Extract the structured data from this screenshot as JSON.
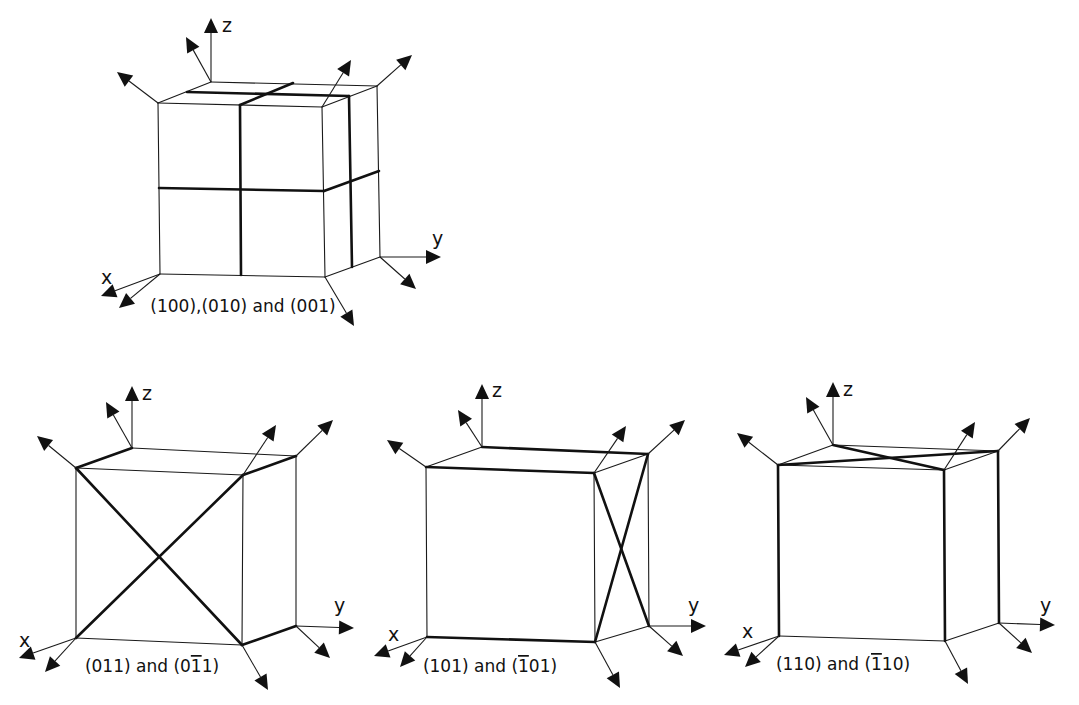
{
  "figure": {
    "colors": {
      "line": "#111111",
      "background": "#ffffff"
    },
    "cubes": [
      {
        "id": "cube-100-010-001",
        "caption": "(100),(010) and (001)",
        "caption_pos": [
          243,
          312
        ],
        "v": {
          "ftl": [
            158,
            103
          ],
          "ftr": [
            322,
            107
          ],
          "fbl": [
            160,
            274
          ],
          "fbr": [
            325,
            277
          ],
          "btl": [
            211,
            82
          ],
          "btr": [
            377,
            86
          ],
          "bbr": [
            380,
            257
          ]
        },
        "thin_edges": [
          [
            "ftl",
            "ftr"
          ],
          [
            "ftl",
            "btl"
          ],
          [
            "btl",
            "btr"
          ],
          [
            "ftr",
            "btr"
          ],
          [
            "ftl",
            "fbl"
          ],
          [
            "fbl",
            "fbr"
          ],
          [
            "ftr",
            "fbr"
          ],
          [
            "btr",
            "bbr"
          ],
          [
            "fbr",
            "bbr"
          ]
        ],
        "thick_lines": [
          [
            [
              240,
              105
            ],
            [
              241,
              275
            ]
          ],
          [
            [
              240,
              105
            ],
            [
              293,
              83
            ]
          ],
          [
            [
              187,
              92
            ],
            [
              349,
              96
            ]
          ],
          [
            [
              349,
              96
            ],
            [
              352,
              267
            ]
          ],
          [
            [
              159,
              188
            ],
            [
              324,
              191
            ]
          ],
          [
            [
              324,
              191
            ],
            [
              379,
              171
            ]
          ]
        ],
        "arrows": [
          {
            "from": [
              211,
              82
            ],
            "to": [
              211,
              18
            ],
            "label": "z",
            "label_pos": [
              222,
              32
            ]
          },
          {
            "from": [
              211,
              82
            ],
            "to": [
              186,
              37
            ]
          },
          {
            "from": [
              158,
              103
            ],
            "to": [
              117,
              72
            ]
          },
          {
            "from": [
              322,
              107
            ],
            "to": [
              351,
              60
            ]
          },
          {
            "from": [
              377,
              86
            ],
            "to": [
              412,
              55
            ]
          },
          {
            "from": [
              380,
              257
            ],
            "to": [
              441,
              257
            ],
            "label": "y",
            "label_pos": [
              432,
              245
            ]
          },
          {
            "from": [
              380,
              257
            ],
            "to": [
              416,
              289
            ]
          },
          {
            "from": [
              160,
              274
            ],
            "to": [
              101,
              296
            ],
            "label": "x",
            "label_pos": [
              101,
              284
            ]
          },
          {
            "from": [
              160,
              274
            ],
            "to": [
              119,
              308
            ]
          },
          {
            "from": [
              325,
              277
            ],
            "to": [
              354,
              326
            ]
          }
        ]
      },
      {
        "id": "cube-011-0-11",
        "caption": "(011) and (0̄1̄1)",
        "caption_pos": [
          152,
          672
        ],
        "caption_parts": [
          {
            "text": "(011) and (0",
            "bar": false
          },
          {
            "text": "1",
            "bar": true
          },
          {
            "text": "1)",
            "bar": false
          }
        ],
        "v": {
          "ftl": [
            76,
            468
          ],
          "ftr": [
            243,
            475
          ],
          "fbl": [
            76,
            638
          ],
          "fbr": [
            242,
            645
          ],
          "btl": [
            132,
            448
          ],
          "btr": [
            296,
            456
          ],
          "bbr": [
            296,
            626
          ]
        },
        "thin_edges": [
          [
            "ftl",
            "ftr"
          ],
          [
            "btl",
            "btr"
          ],
          [
            "ftl",
            "fbl"
          ],
          [
            "fbl",
            "fbr"
          ],
          [
            "ftr",
            "fbr"
          ],
          [
            "btr",
            "bbr"
          ]
        ],
        "thick_lines": [
          [
            [
              76,
              468
            ],
            [
              132,
              448
            ]
          ],
          [
            [
              243,
              475
            ],
            [
              296,
              456
            ]
          ],
          [
            [
              242,
              645
            ],
            [
              296,
              626
            ]
          ],
          [
            [
              76,
              468
            ],
            [
              242,
              645
            ]
          ],
          [
            [
              76,
              638
            ],
            [
              243,
              475
            ]
          ]
        ],
        "arrows": [
          {
            "from": [
              132,
              448
            ],
            "to": [
              132,
              386
            ],
            "label": "z",
            "label_pos": [
              142,
              400
            ]
          },
          {
            "from": [
              132,
              448
            ],
            "to": [
              106,
              402
            ]
          },
          {
            "from": [
              76,
              468
            ],
            "to": [
              37,
              436
            ]
          },
          {
            "from": [
              243,
              475
            ],
            "to": [
              276,
              425
            ]
          },
          {
            "from": [
              296,
              456
            ],
            "to": [
              333,
              420
            ]
          },
          {
            "from": [
              296,
              626
            ],
            "to": [
              354,
              628
            ],
            "label": "y",
            "label_pos": [
              334,
              612
            ]
          },
          {
            "from": [
              296,
              626
            ],
            "to": [
              330,
              658
            ]
          },
          {
            "from": [
              76,
              638
            ],
            "to": [
              19,
              658
            ],
            "label": "x",
            "label_pos": [
              19,
              647
            ]
          },
          {
            "from": [
              76,
              638
            ],
            "to": [
              45,
              672
            ]
          },
          {
            "from": [
              242,
              645
            ],
            "to": [
              268,
              690
            ]
          }
        ]
      },
      {
        "id": "cube-101--101",
        "caption": "(101) and (1̄01)",
        "caption_pos": [
          490,
          672
        ],
        "caption_parts": [
          {
            "text": "(101) and (",
            "bar": false
          },
          {
            "text": "1",
            "bar": true
          },
          {
            "text": "01)",
            "bar": false
          }
        ],
        "v": {
          "ftl": [
            426,
            467
          ],
          "ftr": [
            594,
            473
          ],
          "fbl": [
            427,
            637
          ],
          "fbr": [
            595,
            642
          ],
          "btl": [
            482,
            447
          ],
          "btr": [
            648,
            454
          ],
          "bbr": [
            649,
            626
          ]
        },
        "thin_edges": [
          [
            "ftl",
            "btl"
          ],
          [
            "ftr",
            "btr"
          ],
          [
            "ftl",
            "fbl"
          ],
          [
            "ftr",
            "fbr"
          ],
          [
            "fbr",
            "bbr"
          ],
          [
            "btr",
            "bbr"
          ]
        ],
        "thick_lines": [
          [
            [
              426,
              467
            ],
            [
              594,
              473
            ]
          ],
          [
            [
              482,
              447
            ],
            [
              648,
              454
            ]
          ],
          [
            [
              427,
              637
            ],
            [
              595,
              642
            ]
          ],
          [
            [
              594,
              473
            ],
            [
              649,
              626
            ]
          ],
          [
            [
              595,
              642
            ],
            [
              648,
              454
            ]
          ]
        ],
        "arrows": [
          {
            "from": [
              482,
              447
            ],
            "to": [
              482,
              384
            ],
            "label": "z",
            "label_pos": [
              492,
              397
            ]
          },
          {
            "from": [
              482,
              447
            ],
            "to": [
              458,
              410
            ]
          },
          {
            "from": [
              426,
              467
            ],
            "to": [
              387,
              440
            ]
          },
          {
            "from": [
              594,
              473
            ],
            "to": [
              626,
              426
            ]
          },
          {
            "from": [
              648,
              454
            ],
            "to": [
              685,
              420
            ]
          },
          {
            "from": [
              649,
              626
            ],
            "to": [
              706,
              626
            ],
            "label": "y",
            "label_pos": [
              688,
              612
            ]
          },
          {
            "from": [
              649,
              626
            ],
            "to": [
              683,
              656
            ]
          },
          {
            "from": [
              427,
              637
            ],
            "to": [
              374,
              656
            ],
            "label": "x",
            "label_pos": [
              388,
              641
            ]
          },
          {
            "from": [
              427,
              637
            ],
            "to": [
              400,
              667
            ]
          },
          {
            "from": [
              595,
              642
            ],
            "to": [
              620,
              688
            ]
          }
        ]
      },
      {
        "id": "cube-110--110",
        "caption": "(110) and (1̄10)",
        "caption_pos": [
          843,
          670
        ],
        "caption_parts": [
          {
            "text": "(110) and (",
            "bar": false
          },
          {
            "text": "1",
            "bar": true
          },
          {
            "text": "10)",
            "bar": false
          }
        ],
        "v": {
          "ftl": [
            778,
            465
          ],
          "ftr": [
            944,
            470
          ],
          "fbl": [
            779,
            636
          ],
          "fbr": [
            945,
            641
          ],
          "btl": [
            833,
            445
          ],
          "btr": [
            998,
            451
          ],
          "bbr": [
            999,
            623
          ]
        },
        "thin_edges": [
          [
            "ftl",
            "ftr"
          ],
          [
            "ftl",
            "btl"
          ],
          [
            "btl",
            "btr"
          ],
          [
            "ftr",
            "btr"
          ],
          [
            "fbl",
            "fbr"
          ],
          [
            "fbr",
            "bbr"
          ]
        ],
        "thick_lines": [
          [
            [
              778,
              465
            ],
            [
              779,
              636
            ]
          ],
          [
            [
              944,
              470
            ],
            [
              945,
              641
            ]
          ],
          [
            [
              998,
              451
            ],
            [
              999,
              623
            ]
          ],
          [
            [
              778,
              465
            ],
            [
              998,
              451
            ]
          ],
          [
            [
              833,
              445
            ],
            [
              944,
              470
            ]
          ]
        ],
        "arrows": [
          {
            "from": [
              833,
              445
            ],
            "to": [
              833,
              382
            ],
            "label": "z",
            "label_pos": [
              843,
              396
            ]
          },
          {
            "from": [
              833,
              445
            ],
            "to": [
              806,
              397
            ]
          },
          {
            "from": [
              778,
              465
            ],
            "to": [
              737,
              433
            ]
          },
          {
            "from": [
              944,
              470
            ],
            "to": [
              975,
              422
            ]
          },
          {
            "from": [
              998,
              451
            ],
            "to": [
              1030,
              418
            ]
          },
          {
            "from": [
              999,
              623
            ],
            "to": [
              1055,
              625
            ],
            "label": "y",
            "label_pos": [
              1040,
              612
            ]
          },
          {
            "from": [
              999,
              623
            ],
            "to": [
              1032,
              653
            ]
          },
          {
            "from": [
              779,
              636
            ],
            "to": [
              724,
              655
            ],
            "label": "x",
            "label_pos": [
              742,
              638
            ]
          },
          {
            "from": [
              779,
              636
            ],
            "to": [
              745,
              667
            ]
          },
          {
            "from": [
              945,
              641
            ],
            "to": [
              968,
              684
            ]
          }
        ]
      }
    ]
  }
}
